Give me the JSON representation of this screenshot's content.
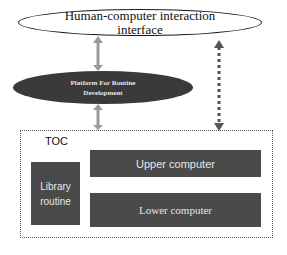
{
  "diagram": {
    "hci": {
      "line1": "Human-computer interaction",
      "line2": "interface"
    },
    "platform": {
      "line1": "Platform For Routine",
      "line2": "Development"
    },
    "toc": {
      "label": "TOC",
      "library": {
        "line1": "Library",
        "line2": "routine"
      },
      "upper": "Upper computer",
      "lower": "Lower computer"
    },
    "connectors": [
      {
        "from": "hci",
        "to": "platform",
        "style": "solid-gray-double-arrow"
      },
      {
        "from": "platform",
        "to": "toc",
        "style": "solid-gray-double-arrow"
      },
      {
        "from": "hci",
        "to": "toc",
        "style": "dotted-dark-double-arrow"
      }
    ],
    "colors": {
      "dark_fill": "#3a3a3a",
      "box_fill": "#4a4a4a",
      "arrow_gray": "#9a9a9a",
      "dotted_arrow": "#555555"
    }
  }
}
